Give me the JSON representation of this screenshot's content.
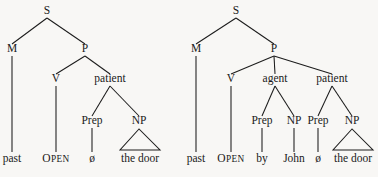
{
  "figure": {
    "background_color": "#f8f7f5",
    "ink_color": "#1c1c1c"
  },
  "trees": [
    {
      "id": "tree-left",
      "name": "left-tree-patient-only",
      "nodes": [
        {
          "id": "L-S",
          "label": "S",
          "x": 47,
          "y": 14
        },
        {
          "id": "L-M",
          "label": "M",
          "x": 12,
          "y": 52
        },
        {
          "id": "L-P",
          "label": "P",
          "x": 85,
          "y": 52
        },
        {
          "id": "L-V",
          "label": "V",
          "x": 56,
          "y": 82
        },
        {
          "id": "L-patient",
          "label": "patient",
          "x": 110,
          "y": 82
        },
        {
          "id": "L-Prep",
          "label": "Prep",
          "x": 92,
          "y": 124
        },
        {
          "id": "L-NP",
          "label": "NP",
          "x": 139,
          "y": 124
        }
      ],
      "branches": [
        {
          "from": "L-S",
          "to": "L-M"
        },
        {
          "from": "L-S",
          "to": "L-P"
        },
        {
          "from": "L-P",
          "to": "L-V"
        },
        {
          "from": "L-P",
          "to": "L-patient"
        },
        {
          "from": "L-patient",
          "to": "L-Prep"
        },
        {
          "from": "L-patient",
          "to": "L-NP"
        }
      ],
      "stems": [
        {
          "from": "L-M",
          "x": 12,
          "y1": 56,
          "y2": 152
        },
        {
          "from": "L-V",
          "x": 56,
          "y1": 86,
          "y2": 152
        },
        {
          "from": "L-Prep",
          "x": 92,
          "y1": 128,
          "y2": 152
        }
      ],
      "triangles": [
        {
          "from": "L-NP",
          "apex_x": 139,
          "apex_y": 129,
          "base_left_x": 120,
          "base_right_x": 160,
          "base_y": 150
        }
      ],
      "terminals": [
        {
          "id": "L-t1",
          "text": "past",
          "x": 12,
          "y": 162,
          "style": "roman"
        },
        {
          "id": "L-t2",
          "text": "OPEN",
          "x": 56,
          "y": 162,
          "style": "smallcaps"
        },
        {
          "id": "L-t3",
          "text": "ø",
          "x": 92,
          "y": 162,
          "style": "null-sym"
        },
        {
          "id": "L-t4",
          "text": "the door",
          "x": 140,
          "y": 162,
          "style": "roman"
        }
      ]
    },
    {
      "id": "tree-right",
      "name": "right-tree-agent-and-patient",
      "nodes": [
        {
          "id": "R-S",
          "label": "S",
          "x": 236,
          "y": 14
        },
        {
          "id": "R-M",
          "label": "M",
          "x": 196,
          "y": 52
        },
        {
          "id": "R-P",
          "label": "P",
          "x": 274,
          "y": 52
        },
        {
          "id": "R-V",
          "label": "V",
          "x": 231,
          "y": 82
        },
        {
          "id": "R-agent",
          "label": "agent",
          "x": 275,
          "y": 82
        },
        {
          "id": "R-patient",
          "label": "patient",
          "x": 332,
          "y": 82
        },
        {
          "id": "R-Prep1",
          "label": "Prep",
          "x": 262,
          "y": 124
        },
        {
          "id": "R-NP1",
          "label": "NP",
          "x": 294,
          "y": 124
        },
        {
          "id": "R-Prep2",
          "label": "Prep",
          "x": 318,
          "y": 124
        },
        {
          "id": "R-NP2",
          "label": "NP",
          "x": 352,
          "y": 124
        }
      ],
      "branches": [
        {
          "from": "R-S",
          "to": "R-M"
        },
        {
          "from": "R-S",
          "to": "R-P"
        },
        {
          "from": "R-P",
          "to": "R-V"
        },
        {
          "from": "R-P",
          "to": "R-agent"
        },
        {
          "from": "R-P",
          "to": "R-patient"
        },
        {
          "from": "R-agent",
          "to": "R-Prep1"
        },
        {
          "from": "R-agent",
          "to": "R-NP1"
        },
        {
          "from": "R-patient",
          "to": "R-Prep2"
        },
        {
          "from": "R-patient",
          "to": "R-NP2"
        }
      ],
      "stems": [
        {
          "from": "R-M",
          "x": 196,
          "y1": 56,
          "y2": 152
        },
        {
          "from": "R-V",
          "x": 231,
          "y1": 86,
          "y2": 152
        },
        {
          "from": "R-Prep1",
          "x": 262,
          "y1": 128,
          "y2": 152
        },
        {
          "from": "R-NP1",
          "x": 294,
          "y1": 128,
          "y2": 152
        },
        {
          "from": "R-Prep2",
          "x": 318,
          "y1": 128,
          "y2": 152
        }
      ],
      "triangles": [
        {
          "from": "R-NP2",
          "apex_x": 352,
          "apex_y": 129,
          "base_left_x": 333,
          "base_right_x": 373,
          "base_y": 150
        }
      ],
      "terminals": [
        {
          "id": "R-t1",
          "text": "past",
          "x": 196,
          "y": 162,
          "style": "roman"
        },
        {
          "id": "R-t2",
          "text": "OPEN",
          "x": 231,
          "y": 162,
          "style": "smallcaps"
        },
        {
          "id": "R-t3",
          "text": "by",
          "x": 262,
          "y": 162,
          "style": "roman"
        },
        {
          "id": "R-t4",
          "text": "John",
          "x": 294,
          "y": 162,
          "style": "roman"
        },
        {
          "id": "R-t5",
          "text": "ø",
          "x": 318,
          "y": 162,
          "style": "null-sym"
        },
        {
          "id": "R-t6",
          "text": "the door",
          "x": 353,
          "y": 162,
          "style": "roman"
        }
      ]
    }
  ]
}
